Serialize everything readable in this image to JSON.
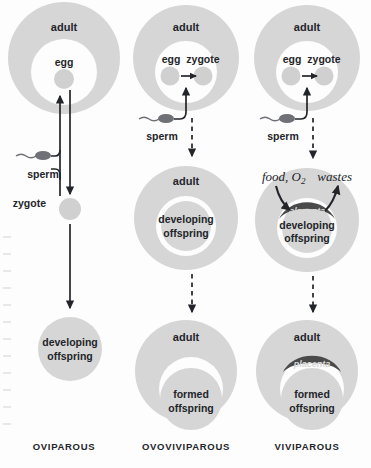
{
  "figure": {
    "background_color": "#fdfdfd",
    "body_fill_color": "#d6d6d6",
    "inner_cavity_color": "#ffffff",
    "cell_fill_color": "#d0d0d0",
    "placenta_color": "#4a4a4a",
    "ink_color": "#23252a"
  },
  "columns": [
    {
      "id": "oviparous",
      "label": "OVIPAROUS",
      "label_x": 64,
      "stages": [
        {
          "name": "adult-with-egg",
          "body_label": "adult",
          "inner_label": "egg"
        },
        {
          "name": "zygote",
          "label": "zygote"
        },
        {
          "name": "developing-offspring",
          "label_line1": "developing",
          "label_line2": "offspring"
        }
      ],
      "gamete": {
        "label": "sperm"
      }
    },
    {
      "id": "ovoviviparous",
      "label": "OVOVIVIPAROUS",
      "label_x": 186,
      "stages": [
        {
          "name": "adult-fertilization",
          "body_label": "adult",
          "inner_label_egg": "egg",
          "inner_label_zygote": "zygote"
        },
        {
          "name": "adult-developing",
          "body_label": "adult",
          "inner_label_line1": "developing",
          "inner_label_line2": "offspring"
        },
        {
          "name": "adult-formed",
          "body_label": "adult",
          "inner_label_line1": "formed",
          "inner_label_line2": "offspring"
        }
      ],
      "gamete": {
        "label": "sperm"
      }
    },
    {
      "id": "viviparous",
      "label": "VIVIPAROUS",
      "label_x": 307,
      "stages": [
        {
          "name": "adult-fertilization",
          "body_label": "adult",
          "inner_label_egg": "egg",
          "inner_label_zygote": "zygote"
        },
        {
          "name": "adult-placenta-developing",
          "inner_label_line1": "developing",
          "inner_label_line2": "offspring",
          "placenta_label": "placenta",
          "exchange_in": "food, O",
          "exchange_in_sub": "2",
          "exchange_out": "wastes"
        },
        {
          "name": "adult-placenta-formed",
          "body_label": "adult",
          "inner_label_line1": "formed",
          "inner_label_line2": "offspring",
          "placenta_label": "placenta"
        }
      ],
      "gamete": {
        "label": "sperm"
      }
    }
  ]
}
